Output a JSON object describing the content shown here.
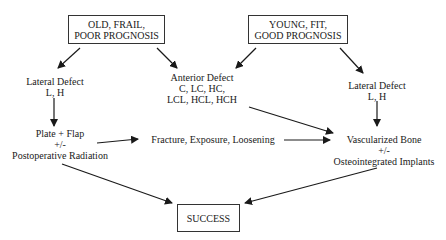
{
  "diagram": {
    "nodes": {
      "old_frail": {
        "lines": [
          "OLD, FRAIL,",
          "POOR PROGNOSIS"
        ]
      },
      "young_fit": {
        "lines": [
          "YOUNG, FIT,",
          "GOOD PROGNOSIS"
        ]
      },
      "lateral_left": {
        "lines": [
          "Lateral Defect",
          "L, H"
        ]
      },
      "anterior": {
        "lines": [
          "Anterior Defect",
          "C, LC, HC,",
          "LCL, HCL, HCH"
        ]
      },
      "lateral_right": {
        "lines": [
          "Lateral Defect",
          "L, H"
        ]
      },
      "plate_flap": {
        "lines": [
          "Plate + Flap",
          "+/-",
          "Postoperative Radiation"
        ]
      },
      "complications": {
        "lines": [
          "Fracture, Exposure, Loosening"
        ]
      },
      "vascularized": {
        "lines": [
          "Vascularized Bone",
          "+/-",
          "Osteointegrated Implants"
        ]
      },
      "success": {
        "lines": [
          "SUCCESS"
        ]
      }
    },
    "edges": [
      {
        "from": "old_frail",
        "to": "lateral_left"
      },
      {
        "from": "old_frail",
        "to": "anterior"
      },
      {
        "from": "young_fit",
        "to": "anterior"
      },
      {
        "from": "young_fit",
        "to": "lateral_right"
      },
      {
        "from": "lateral_left",
        "to": "plate_flap"
      },
      {
        "from": "lateral_right",
        "to": "vascularized"
      },
      {
        "from": "plate_flap",
        "to": "complications"
      },
      {
        "from": "complications",
        "to": "vascularized"
      },
      {
        "from": "anterior",
        "to": "vascularized"
      },
      {
        "from": "plate_flap",
        "to": "success"
      },
      {
        "from": "vascularized",
        "to": "success"
      }
    ],
    "colors": {
      "line": "#1a1a1a",
      "box_border": "#333333",
      "background": "#ffffff"
    }
  }
}
